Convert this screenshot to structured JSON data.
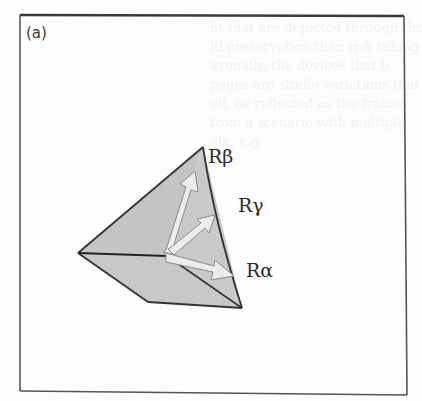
{
  "figure": {
    "panel_label": "(a)",
    "frame": {
      "top_left": [
        20,
        15
      ],
      "top_right": [
        404,
        16
      ],
      "bottom_right": [
        407,
        395
      ],
      "bottom_left": [
        20,
        391
      ],
      "stroke": "#4a4a4a"
    },
    "pyramid": {
      "vertices": {
        "apex": [
          203,
          147
        ],
        "left": [
          78,
          253
        ],
        "center": [
          167,
          256
        ],
        "bottom_right": [
          242,
          308
        ],
        "bottom_left": [
          148,
          302
        ]
      },
      "face_fill": "#c6c6c6",
      "edge_stroke": "#333333"
    },
    "axes": [
      {
        "id": "R_alpha",
        "label": "Rα",
        "label_pos": [
          246,
          277
        ],
        "from": [
          168,
          257
        ],
        "to": [
          234,
          276
        ]
      },
      {
        "id": "R_beta",
        "label": "Rβ",
        "label_pos": [
          208,
          162
        ],
        "from": [
          168,
          253
        ],
        "to": [
          196,
          172
        ]
      },
      {
        "id": "R_gamma",
        "label": "Rγ",
        "label_pos": [
          238,
          211
        ],
        "from": [
          172,
          252
        ],
        "to": [
          215,
          216
        ]
      }
    ],
    "arrow_fill": "#ececec",
    "arrow_stroke": "#8a8a8a"
  },
  "bleed_through": {
    "note": "faint show-through from reverse side of scanned page",
    "lines": [
      "ht that are depicted through the",
      "ld preservation than risk taking",
      "ayonally, the devices that b",
      "pages are studio variations that",
      "elf, be reflected as the frames",
      "from a scenario with multiple",
      "ate, e.g. "
    ]
  }
}
